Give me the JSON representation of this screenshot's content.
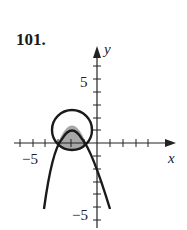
{
  "problem_number": "101.",
  "axes": {
    "x_label": "x",
    "y_label": "y",
    "x_tick_label": "−5",
    "y_tick_top_label": "5",
    "y_tick_bottom_label": "−5"
  },
  "colors": {
    "curve": "#1a1a1a",
    "shaded_region": "#a8a8a8"
  },
  "figure": {
    "circle": "circle centered at (-2, 1) radius ~1.8",
    "parabola": "downward-opening parabola with vertex near (-2, 1)",
    "shaded": "intersection region of circle interior and parabola interior"
  }
}
